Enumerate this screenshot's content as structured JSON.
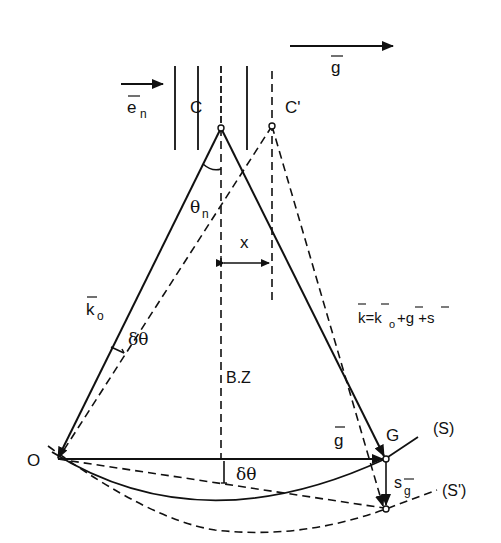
{
  "diagram": {
    "colors": {
      "ink": "#111111",
      "background": "#ffffff"
    },
    "labels": {
      "g_top": "g",
      "e_n": "e",
      "e_n_sub": "n",
      "C": "C",
      "C_prime": "C'",
      "theta_n": "θ",
      "theta_n_sub": "n",
      "x": "x",
      "k0": "k",
      "k0_sub": "o",
      "delta_theta_upper": "δθ",
      "BZ": "B.Z",
      "k_equation": "k=k",
      "k_equation_sub": "o",
      "k_equation_rest": " +g +s",
      "O": "O",
      "g_mid": "g",
      "G": "G",
      "S": "(S)",
      "delta_theta_lower": "δθ",
      "s_g": "s",
      "s_g_sub": "g",
      "S_prime": "(S')"
    }
  }
}
